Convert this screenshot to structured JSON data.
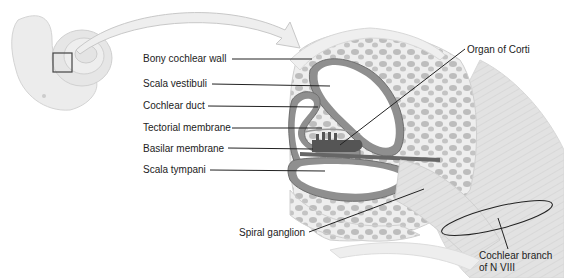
{
  "diagram": {
    "labels": {
      "bony_cochlear_wall": "Bony cochlear wall",
      "scala_vestibuli": "Scala vestibuli",
      "cochlear_duct": "Cochlear duct",
      "tectorial_membrane": "Tectorial membrane",
      "basilar_membrane": "Basilar membrane",
      "scala_tympani": "Scala tympani",
      "organ_of_corti": "Organ of Corti",
      "spiral_ganglion": "Spiral ganglion",
      "cochlear_branch_line1": "Cochlear branch",
      "cochlear_branch_line2": "of N VIII"
    },
    "colors": {
      "bone": "#e9e9e9",
      "bone_dark": "#cfcfcf",
      "duct": "#8f8f8f",
      "duct_dark": "#6e6e6e",
      "nerve": "#dedede",
      "leader_line": "#222222"
    }
  }
}
